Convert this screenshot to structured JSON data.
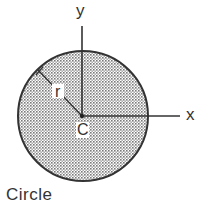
{
  "figure": {
    "shape": "circle",
    "caption": "Circle",
    "labels": {
      "y_axis": "y",
      "x_axis": "x",
      "radius": "r",
      "centroid": "C"
    },
    "colors": {
      "outline": "#333333",
      "fill_pattern": "#7a7a7a",
      "background": "#ffffff"
    }
  }
}
